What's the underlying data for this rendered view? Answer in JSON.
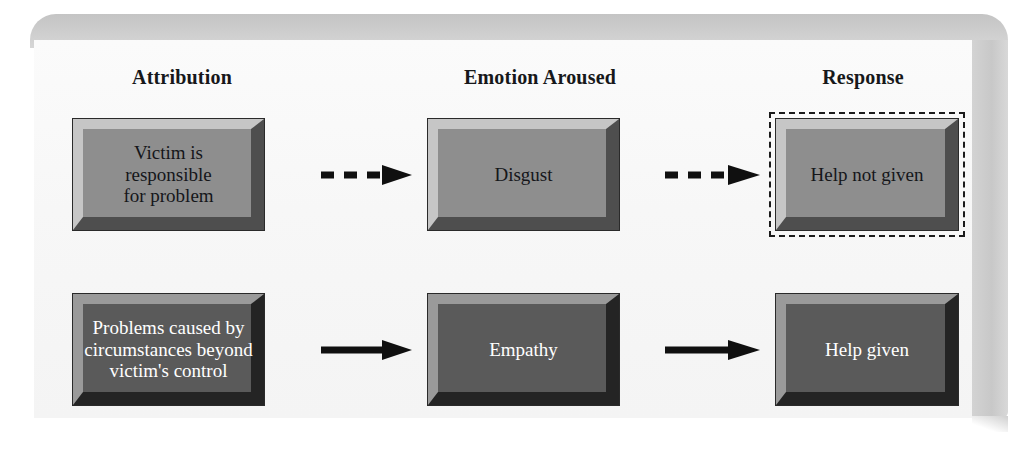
{
  "figure": {
    "columns": [
      {
        "id": "attribution",
        "label": "Attribution"
      },
      {
        "id": "emotion",
        "label": "Emotion Aroused"
      },
      {
        "id": "response",
        "label": "Response"
      }
    ],
    "rows": [
      {
        "id": "controllable-path",
        "style": "light",
        "arrow_style": "dashed",
        "nodes": {
          "attribution": "Victim is\nresponsible\nfor problem",
          "emotion": "Disgust",
          "response": "Help not given"
        },
        "response_highlighted": true
      },
      {
        "id": "uncontrollable-path",
        "style": "dark",
        "arrow_style": "solid",
        "nodes": {
          "attribution": "Problems caused by\ncircumstances beyond\nvictim's control",
          "emotion": "Empathy",
          "response": "Help given"
        },
        "response_highlighted": false
      }
    ],
    "colors": {
      "frame_band": "#c9c9c9",
      "paper": "#f7f7f7",
      "light_box_face": "#8e8e8e",
      "light_box_highlight": "#c6c6c6",
      "light_box_shadow": "#4e4e4e",
      "dark_box_face": "#5a5a5a",
      "dark_box_highlight": "#9a9a9a",
      "dark_box_shadow": "#242424",
      "outline": "#1b1b1b",
      "light_text": "#15161a",
      "dark_text": "#ffffff"
    }
  }
}
